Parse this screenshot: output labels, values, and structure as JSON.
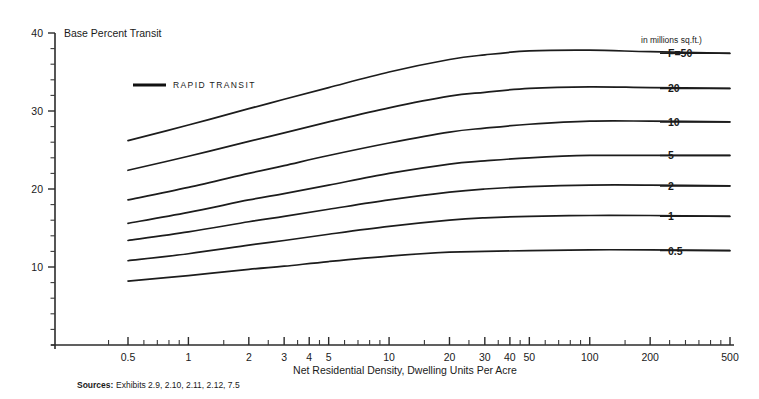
{
  "chart_data": {
    "type": "line",
    "title": "Base Percent Transit",
    "subtitle": "",
    "xlabel": "Net Residential Density, Dwelling Units Per Acre",
    "ylabel": "Base Percent Transit",
    "xscale": "log",
    "xlim": [
      0.35,
      500
    ],
    "ylim": [
      0,
      40
    ],
    "grid": false,
    "legend_position": "right",
    "legend_entries": [
      "RAPID TRANSIT"
    ],
    "units_note": "in millions sq.ft.)",
    "x_tick_labels": [
      "0.5",
      "1",
      "2",
      "3",
      "4",
      "5",
      "10",
      "20",
      "30",
      "40",
      "50",
      "100",
      "200",
      "500"
    ],
    "x_tick_values": [
      0.5,
      1,
      2,
      3,
      4,
      5,
      10,
      20,
      30,
      40,
      50,
      100,
      200,
      500
    ],
    "y_tick_labels": [
      "10",
      "20",
      "30",
      "40"
    ],
    "y_tick_values": [
      10,
      20,
      30,
      40
    ],
    "y_minor_step": 2,
    "x": [
      0.5,
      1,
      2,
      3,
      5,
      10,
      20,
      30,
      50,
      100,
      200,
      500
    ],
    "series": [
      {
        "name": "F=50",
        "label": "F=50",
        "values": [
          26.2,
          28.2,
          30.3,
          31.5,
          33.0,
          35.0,
          36.6,
          37.2,
          37.7,
          37.8,
          37.6,
          37.4
        ]
      },
      {
        "name": "20",
        "label": "20",
        "values": [
          22.4,
          24.2,
          26.1,
          27.2,
          28.6,
          30.4,
          31.9,
          32.4,
          32.9,
          33.1,
          33.0,
          32.9
        ]
      },
      {
        "name": "10",
        "label": "10",
        "values": [
          18.6,
          20.2,
          22.0,
          23.0,
          24.3,
          25.9,
          27.3,
          27.8,
          28.3,
          28.7,
          28.7,
          28.6
        ]
      },
      {
        "name": "5",
        "label": "5",
        "values": [
          15.6,
          17.0,
          18.6,
          19.4,
          20.5,
          22.0,
          23.2,
          23.6,
          24.0,
          24.3,
          24.3,
          24.3
        ]
      },
      {
        "name": "2",
        "label": "2",
        "values": [
          13.4,
          14.5,
          15.8,
          16.5,
          17.4,
          18.6,
          19.6,
          20.0,
          20.3,
          20.5,
          20.5,
          20.4
        ]
      },
      {
        "name": "1",
        "label": "1",
        "values": [
          10.8,
          11.7,
          12.8,
          13.4,
          14.2,
          15.2,
          16.0,
          16.3,
          16.5,
          16.6,
          16.6,
          16.5
        ]
      },
      {
        "name": "0.5",
        "label": "0.5",
        "values": [
          8.2,
          8.9,
          9.7,
          10.1,
          10.7,
          11.4,
          11.9,
          12.0,
          12.1,
          12.2,
          12.2,
          12.1
        ]
      }
    ],
    "sources_label": "Sources:",
    "sources_text": "Exhibits 2.9, 2.10, 2.11, 2.12, 7.5",
    "colors": {
      "line": "#1c1c1c",
      "axis": "#2b2b2b",
      "background": "#ffffff"
    }
  }
}
